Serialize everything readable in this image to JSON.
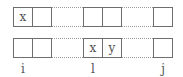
{
  "diagram": {
    "rows": [
      {
        "groups": [
          {
            "cells": [
              "x",
              ""
            ]
          },
          {
            "cells": [
              "",
              ""
            ]
          },
          {
            "cells": [
              ""
            ]
          }
        ]
      },
      {
        "groups": [
          {
            "cells": [
              "",
              ""
            ]
          },
          {
            "cells": [
              "x",
              "y"
            ]
          },
          {
            "cells": [
              ""
            ]
          }
        ]
      }
    ],
    "labels": [
      "i",
      "l",
      "j"
    ],
    "connector_style": "dotted"
  }
}
